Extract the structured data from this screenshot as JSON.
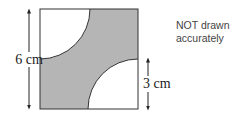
{
  "diagram": {
    "square": {
      "side_label": "6 cm"
    },
    "quarter_circle": {
      "radius_label": "3 cm"
    },
    "note": {
      "line1": "NOT drawn",
      "line2": "accurately"
    },
    "colors": {
      "shade": "#b5b5b5",
      "stroke": "#333333",
      "background": "#ffffff"
    }
  }
}
